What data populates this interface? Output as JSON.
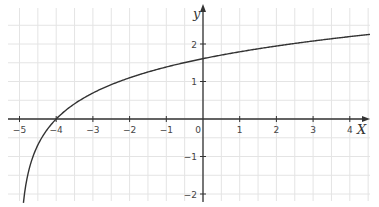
{
  "chart_data": {
    "type": "line",
    "title": "",
    "function": "y = ln(x + 5)",
    "xlabel": "X",
    "ylabel": "y",
    "xlim": [
      -5.3,
      4.6
    ],
    "ylim": [
      -2.4,
      2.9
    ],
    "grid": true,
    "grid_step": 0.5,
    "x_ticks": [
      -5,
      -4,
      -3,
      -2,
      -1,
      0,
      1,
      2,
      3,
      4
    ],
    "x_tick_labels": [
      "-5",
      "-4",
      "-3",
      "-2",
      "-1",
      "0",
      "1",
      "2",
      "3",
      "4"
    ],
    "y_ticks": [
      -2,
      -1,
      1,
      2
    ],
    "y_tick_labels": [
      "-2",
      "-1",
      "1",
      "2"
    ],
    "series": [
      {
        "name": "ln(x+5)",
        "x": [
          -4.89,
          -4.8,
          -4.7,
          -4.5,
          -4.25,
          -4,
          -3.5,
          -3,
          -2.5,
          -2,
          -1,
          0,
          1,
          2,
          3,
          4,
          4.5
        ],
        "y": [
          -2.21,
          -1.61,
          -1.2,
          -0.69,
          -0.29,
          0,
          0.41,
          0.69,
          0.92,
          1.1,
          1.39,
          1.61,
          1.79,
          1.95,
          2.08,
          2.2,
          2.25
        ]
      }
    ],
    "annotations": [
      "x-intercept at (-4, 0)",
      "y-intercept at (0, 1.61)"
    ]
  },
  "colors": {
    "grid": "#e4e4e4",
    "axis": "#333333",
    "curve": "#333333"
  },
  "layout": {
    "origin_px": [
      203,
      119
    ],
    "px_per_unit_x": 36.7,
    "px_per_unit_y": 37.5
  }
}
